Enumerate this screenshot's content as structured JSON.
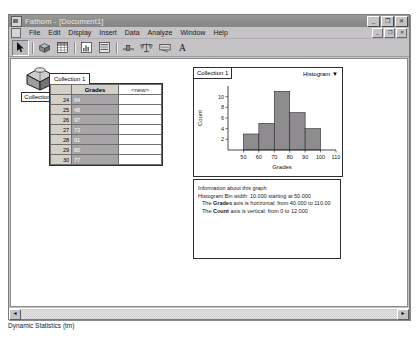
{
  "window": {
    "title": "Fathom - [Document1]",
    "icon": "fathom-app-icon",
    "buttons": {
      "minimize": "_",
      "restore": "❐",
      "close": "✕"
    },
    "doc_buttons": {
      "minimize": "_",
      "restore": "❐",
      "close": "✕"
    }
  },
  "menubar": {
    "items": [
      {
        "label": "File"
      },
      {
        "label": "Edit"
      },
      {
        "label": "Display"
      },
      {
        "label": "Insert"
      },
      {
        "label": "Data"
      },
      {
        "label": "Analyze"
      },
      {
        "label": "Window"
      },
      {
        "label": "Help"
      }
    ]
  },
  "toolbar": {
    "tools": [
      {
        "name": "arrow-select-tool",
        "icon": "arrow-icon",
        "pressed": true
      },
      {
        "name": "collection-tool",
        "icon": "collection-box-icon"
      },
      {
        "name": "case-table-tool",
        "icon": "table-icon"
      },
      {
        "name": "graph-tool",
        "icon": "graph-icon"
      },
      {
        "name": "summary-table-tool",
        "icon": "summary-table-icon"
      },
      {
        "name": "slider-tool",
        "icon": "slider-icon"
      },
      {
        "name": "test-tool",
        "icon": "balance-scale-icon"
      },
      {
        "name": "estimate-tool",
        "icon": "estimate-icon"
      },
      {
        "name": "text-tool",
        "icon": "text-a-icon"
      }
    ]
  },
  "collection": {
    "name": "Collection 1",
    "icon": "collection-box-icon"
  },
  "case_table": {
    "tab_label": "Collection 1",
    "columns": [
      "",
      "Grades",
      "<new>"
    ],
    "rows": [
      {
        "index": "24",
        "grades": "64"
      },
      {
        "index": "25",
        "grades": "48"
      },
      {
        "index": "26",
        "grades": "97"
      },
      {
        "index": "27",
        "grades": "73"
      },
      {
        "index": "28",
        "grades": "91"
      },
      {
        "index": "29",
        "grades": "80"
      },
      {
        "index": "30",
        "grades": "77"
      }
    ]
  },
  "graph": {
    "tab_label": "Collection 1",
    "plot_type": "Histogram",
    "dropdown_icon": "chevron-down-icon"
  },
  "chart_data": {
    "type": "bar",
    "title": "",
    "xlabel": "Grades",
    "ylabel": "Count",
    "categories": [
      "50-60",
      "60-70",
      "70-80",
      "80-90",
      "90-100"
    ],
    "bin_starts": [
      50,
      60,
      70,
      80,
      90
    ],
    "bin_width": 10,
    "values": [
      3,
      5,
      11,
      7,
      4
    ],
    "xlim": [
      40,
      110
    ],
    "ylim": [
      0,
      12
    ],
    "xticks": [
      "50",
      "60",
      "70",
      "80",
      "90",
      "100",
      "110"
    ],
    "xtick_values": [
      50,
      60,
      70,
      80,
      90,
      100,
      110
    ],
    "yticks": [
      "2",
      "4",
      "6",
      "8",
      "10"
    ],
    "ytick_values": [
      2,
      4,
      6,
      8,
      10
    ],
    "grid": false,
    "legend": false,
    "bar_color": "#8f8c8f"
  },
  "info_panel": {
    "lines": [
      {
        "text": "Information about this graph",
        "indent": false
      },
      {
        "text": "Histogram Bin width: 10.000  starting at 50.000",
        "indent": false
      },
      {
        "prefix": "The ",
        "bold": "Grades",
        "suffix": " axis is horizontal:  from 40.000 to 110.00",
        "indent": true
      },
      {
        "prefix": "The ",
        "bold": "Count",
        "suffix": " axis is vertical:  from 0 to 12.000",
        "indent": true
      }
    ]
  },
  "statusbar": {
    "text": "Dynamic Statistics (tm)"
  },
  "scrollbar": {
    "left_arrow": "◄",
    "right_arrow": "►"
  }
}
